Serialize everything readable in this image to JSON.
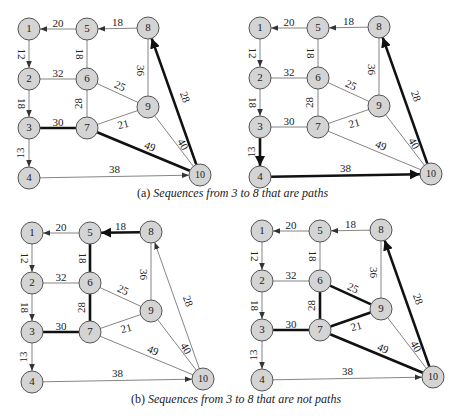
{
  "colors": {
    "node_fill": "#d4d4d4",
    "node_stroke": "#555555",
    "edge": "#777777",
    "edge_bold": "#111111",
    "text": "#222222"
  },
  "nodes": {
    "1": [
      0,
      0
    ],
    "5": [
      58,
      0
    ],
    "8": [
      119,
      -1
    ],
    "2": [
      0,
      50
    ],
    "6": [
      58,
      50
    ],
    "9": [
      119,
      78
    ],
    "3": [
      0,
      99
    ],
    "7": [
      58,
      99
    ],
    "4": [
      0,
      149
    ],
    "10": [
      171,
      146
    ]
  },
  "edges": [
    {
      "from": "5",
      "to": "1",
      "w": "20",
      "dir": true,
      "lx": 0,
      "ly": -5
    },
    {
      "from": "8",
      "to": "5",
      "w": "18",
      "dir": true,
      "lx": 0,
      "ly": -5
    },
    {
      "from": "1",
      "to": "2",
      "w": "12",
      "dir": true,
      "lx": -8,
      "ly": 0,
      "rot": 90
    },
    {
      "from": "5",
      "to": "6",
      "w": "18",
      "dir": false,
      "lx": -8,
      "ly": 0,
      "rot": 90
    },
    {
      "from": "8",
      "to": "9",
      "w": "36",
      "dir": false,
      "lx": -8,
      "ly": 3,
      "rot": 90
    },
    {
      "from": "2",
      "to": "6",
      "w": "32",
      "dir": false,
      "lx": 0,
      "ly": -5
    },
    {
      "from": "6",
      "to": "9",
      "w": "25",
      "dir": false,
      "lx": 2,
      "ly": -6,
      "rot": 25
    },
    {
      "from": "2",
      "to": "3",
      "w": "18",
      "dir": true,
      "lx": -8,
      "ly": 0,
      "rot": 90
    },
    {
      "from": "6",
      "to": "7",
      "w": "28",
      "dir": false,
      "lx": -8,
      "ly": 0,
      "rot": -90
    },
    {
      "from": "3",
      "to": "7",
      "w": "30",
      "dir": false,
      "lx": 0,
      "ly": -5
    },
    {
      "from": "7",
      "to": "9",
      "w": "21",
      "dir": false,
      "lx": 6,
      "ly": 8,
      "rot": -15
    },
    {
      "from": "3",
      "to": "4",
      "w": "13",
      "dir": true,
      "lx": -8,
      "ly": 0,
      "rot": -90
    },
    {
      "from": "7",
      "to": "10",
      "w": "49",
      "dir": false,
      "lx": 6,
      "ly": -4,
      "rot": 23
    },
    {
      "from": "9",
      "to": "10",
      "w": "40",
      "dir": false,
      "lx": 8,
      "ly": 4,
      "rot": 60
    },
    {
      "from": "10",
      "to": "8",
      "w": "28",
      "dir": true,
      "lx": 10,
      "ly": -4,
      "rot": 70
    },
    {
      "from": "4",
      "to": "10",
      "w": "38",
      "dir": true,
      "lx": 0,
      "ly": -6
    }
  ],
  "panels": [
    {
      "id": "a-left",
      "ox": 29,
      "oy": 29,
      "bold": [
        "3-7",
        "7-10",
        "10-8"
      ]
    },
    {
      "id": "a-right",
      "ox": 260,
      "oy": 28,
      "bold": [
        "3-4",
        "4-10",
        "10-8"
      ]
    },
    {
      "id": "b-left",
      "ox": 32,
      "oy": 233,
      "bold": [
        "3-7",
        "7-6",
        "6-5",
        "8-5"
      ]
    },
    {
      "id": "b-right",
      "ox": 262,
      "oy": 231,
      "bold": [
        "3-7",
        "7-6",
        "6-9",
        "9-7",
        "7-10",
        "10-8"
      ]
    }
  ],
  "captions": {
    "a": {
      "prefix": "(a) ",
      "text": "Sequences from 3 to 8 that are paths"
    },
    "b": {
      "prefix": "(b) ",
      "text": "Sequences from 3 to 8 that are not paths"
    }
  }
}
